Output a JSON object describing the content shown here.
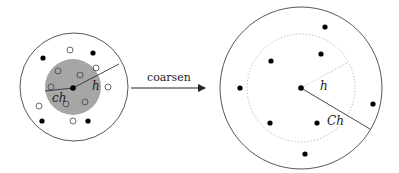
{
  "diagram": {
    "left": {
      "outer_circle": {
        "cx": 74,
        "cy": 87,
        "r": 54
      },
      "inner_disk": {
        "cx": 73,
        "cy": 87,
        "r": 28,
        "fill": "#a6a6a6"
      },
      "center_point": {
        "cx": 73,
        "cy": 88
      },
      "radius_h_label": "h",
      "radius_ch_label": "ch",
      "filled_points": [
        [
          43,
          58
        ],
        [
          93,
          53
        ],
        [
          42,
          121
        ],
        [
          88,
          121
        ]
      ],
      "hollow_points": [
        [
          70,
          50
        ],
        [
          96,
          68
        ],
        [
          108,
          87
        ],
        [
          39,
          106
        ],
        [
          73,
          121
        ],
        [
          58,
          71
        ],
        [
          80,
          75
        ],
        [
          51,
          87
        ],
        [
          66,
          104
        ],
        [
          85,
          102
        ]
      ]
    },
    "arrow": {
      "label": "coarsen"
    },
    "right": {
      "outer_circle": {
        "cx": 301,
        "cy": 88,
        "r": 81
      },
      "dotted_circle": {
        "cx": 301,
        "cy": 88,
        "r": 54
      },
      "center_point": {
        "cx": 301,
        "cy": 88
      },
      "radius_h_label": "h",
      "radius_Ch_label": "Ch",
      "filled_points": [
        [
          325,
          27
        ],
        [
          321,
          54
        ],
        [
          271,
          61
        ],
        [
          240,
          88
        ],
        [
          373,
          104
        ],
        [
          270,
          123
        ],
        [
          317,
          123
        ],
        [
          305,
          154
        ]
      ]
    }
  }
}
